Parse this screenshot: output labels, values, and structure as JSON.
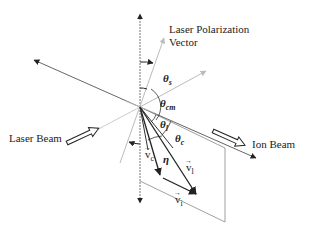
{
  "diagram": {
    "labels": {
      "polarization_line1": "Laser Polarization",
      "polarization_line2": "Vector",
      "laser_beam": "Laser Beam",
      "ion_beam": "Ion Beam"
    },
    "angles": {
      "theta_s": {
        "symbol": "θ",
        "sub": "s"
      },
      "theta_cm": {
        "symbol": "θ",
        "sub": "cm"
      },
      "theta_l": {
        "symbol": "θ",
        "sub": "l"
      },
      "theta_c": {
        "symbol": "θ",
        "sub": "c"
      },
      "eta": {
        "symbol": "η"
      }
    },
    "vectors": {
      "v_c": {
        "symbol": "v",
        "sub": "c",
        "arrow": "→"
      },
      "v_l": {
        "symbol": "v",
        "sub": "l",
        "arrow": "→"
      },
      "v_i": {
        "symbol": "v",
        "sub": "i",
        "arrow": "→"
      }
    },
    "colors": {
      "line": "#555555",
      "dark": "#222222",
      "light": "#bbbbbb"
    }
  }
}
